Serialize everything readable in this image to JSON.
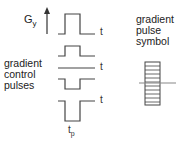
{
  "axis": {
    "label": "G",
    "subscript": "y"
  },
  "left_label": {
    "line1": "gradient",
    "line2": "control",
    "line3": "pulses"
  },
  "right_label": {
    "line1": "gradient",
    "line2": "pulse",
    "line3": "symbol"
  },
  "time_labels": {
    "t": "t",
    "tp_main": "t",
    "tp_sub": "p"
  },
  "colors": {
    "line": "#444444",
    "symbol_line": "#888888"
  }
}
